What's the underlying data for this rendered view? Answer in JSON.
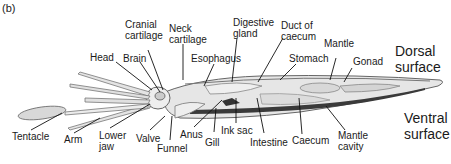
{
  "panel_label": "(b)",
  "labels": {
    "cranial_cartilage": [
      "Cranial",
      "cartilage"
    ],
    "neck_cartilage": [
      "Neck",
      "cartilage"
    ],
    "digestive_gland": [
      "Digestive",
      "gland"
    ],
    "duct_of_caecum": [
      "Duct of",
      "caecum"
    ],
    "mantle": "Mantle",
    "gonad": "Gonad",
    "head": "Head",
    "brain": "Brain",
    "esophagus": "Esophagus",
    "stomach": "Stomach",
    "tentacle": "Tentacle",
    "arm": "Arm",
    "lower_jaw": [
      "Lower",
      "jaw"
    ],
    "valve": "Valve",
    "funnel": "Funnel",
    "anus": "Anus",
    "gill": "Gill",
    "ink_sac": "Ink sac",
    "intestine": "Intestine",
    "caecum": "Caecum",
    "mantle_cavity": [
      "Mantle",
      "cavity"
    ]
  },
  "surfaces": {
    "dorsal": [
      "Dorsal",
      "surface"
    ],
    "ventral": [
      "Ventral",
      "surface"
    ]
  },
  "colors": {
    "outline": "#555555",
    "fill": "#e4e4e4",
    "dark_band": "#3a3a3a",
    "leader": "#111111"
  }
}
